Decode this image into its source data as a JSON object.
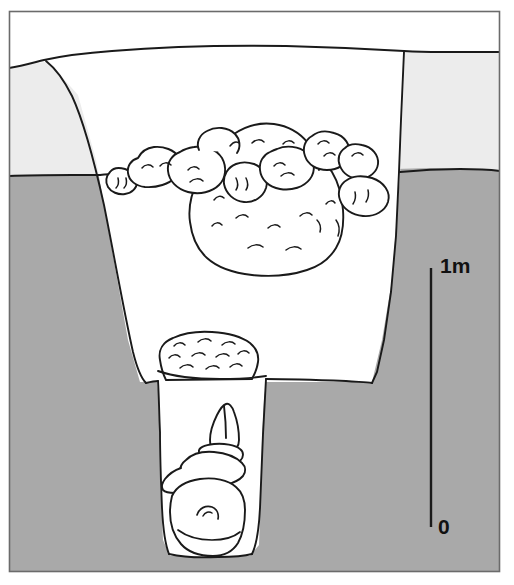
{
  "figure": {
    "type": "section-drawing",
    "width": 514,
    "height": 585
  },
  "scale": {
    "top_label": "1m",
    "bottom_label": "0",
    "orientation": "vertical",
    "bar_top_y": 268,
    "bar_bottom_y": 527,
    "bar_x": 431,
    "unit": "m",
    "span": 1
  },
  "colors": {
    "topsoil": "#ececec",
    "subsoil": "#a9a9a9",
    "fill": "#ffffff",
    "outline": "#1a1a1a",
    "frame": "#6b6b6b",
    "background": "#ffffff",
    "label": "#111111"
  },
  "legend_layers": [
    {
      "name": "topsoil",
      "label": "Upper soil horizon",
      "color": "#ececec"
    },
    {
      "name": "subsoil",
      "label": "Natural subsoil",
      "color": "#a9a9a9"
    },
    {
      "name": "pit-fill",
      "label": "Pit fill",
      "color": "#ffffff"
    }
  ],
  "features": [
    {
      "name": "ground-surface",
      "label": "Ground surface"
    },
    {
      "name": "pit-cut",
      "label": "Large pit cut"
    },
    {
      "name": "shaft-cut",
      "label": "Narrow shaft cut"
    },
    {
      "name": "boulder-cluster",
      "label": "Stone / boulder packing"
    },
    {
      "name": "capping-stone",
      "label": "Capping stone over shaft"
    },
    {
      "name": "vessel-deposit",
      "label": "Vessel deposit in shaft"
    },
    {
      "name": "basal-stone",
      "label": "Basal stone at shaft bottom"
    }
  ]
}
